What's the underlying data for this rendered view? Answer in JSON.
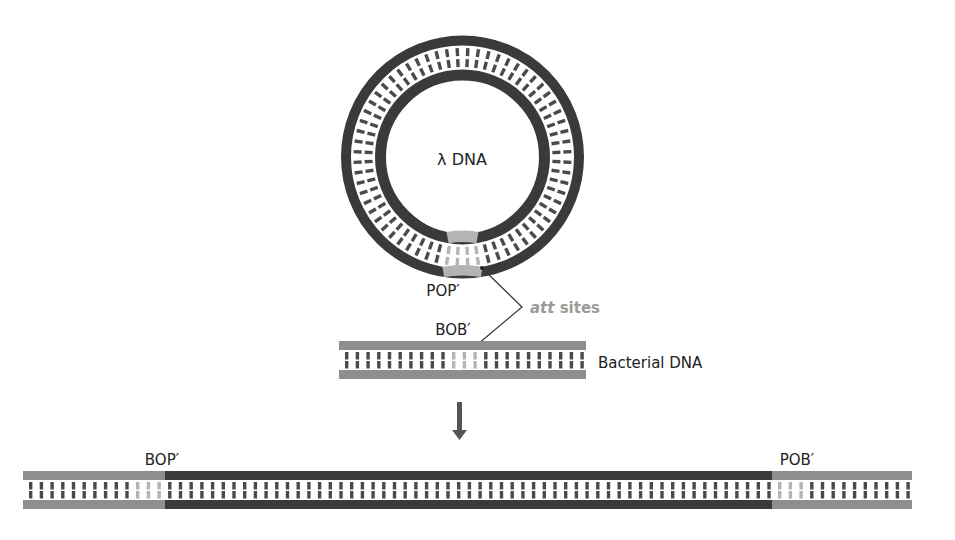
{
  "diagram": {
    "lambda_label": "λ DNA",
    "pop_label": "POP′",
    "att_italic": "att",
    "att_rest": " sites",
    "bob_label": "BOB′",
    "bacterial_label": "Bacterial DNA",
    "bop_label": "BOP′",
    "pob_label": "POB′"
  },
  "colors": {
    "phage_dark": "#3a3a3a",
    "bacterial_gray": "#8e8e8e",
    "att_light": "#b4b4b4",
    "att_label": "#9a9a9a",
    "rung_dark": "#4a4a4a",
    "rung_gray": "#7e7e7e"
  },
  "icons": {
    "arrow": "down-arrow-icon"
  }
}
